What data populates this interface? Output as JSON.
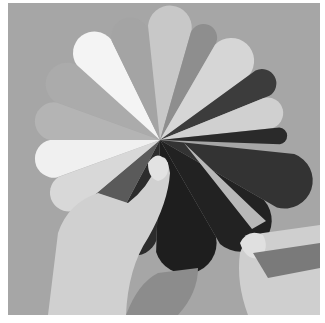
{
  "image": {
    "subject": "Hands holding a paper fan-shaped color wheel (grayscale photo)",
    "style": "grayscale photograph",
    "colors": {
      "frame": "#ffffff",
      "background": "#a6a6a6",
      "skin": "#d2d2d2",
      "skin_shadow": "#9a9a9a"
    },
    "fan": {
      "center": [
        152,
        137
      ],
      "wedges": [
        {
          "start": 200,
          "end": 222,
          "radius": 112,
          "fill": "#ababab"
        },
        {
          "start": 222,
          "end": 244,
          "radius": 112,
          "fill": "#f4f4f4"
        },
        {
          "start": 244,
          "end": 264,
          "radius": 110,
          "fill": "#a4a4a4"
        },
        {
          "start": 264,
          "end": 286,
          "radius": 115,
          "fill": "#c8c8c8"
        },
        {
          "start": 286,
          "end": 300,
          "radius": 112,
          "fill": "#8e8e8e"
        },
        {
          "start": 300,
          "end": 324,
          "radius": 110,
          "fill": "#d6d6d6"
        },
        {
          "start": 324,
          "end": 338,
          "radius": 118,
          "fill": "#3c3c3c"
        },
        {
          "start": 338,
          "end": 354,
          "radius": 112,
          "fill": "#d0d0d0"
        },
        {
          "start": 354,
          "end": 362,
          "radius": 120,
          "fill": "#2a2a2a"
        },
        {
          "start": 6,
          "end": 30,
          "radius": 135,
          "fill": "#333333"
        },
        {
          "start": 30,
          "end": 60,
          "radius": 120,
          "fill": "#222222"
        },
        {
          "start": 60,
          "end": 92,
          "radius": 112,
          "fill": "#1e1e1e"
        },
        {
          "start": 92,
          "end": 118,
          "radius": 100,
          "fill": "#2c2c2c"
        },
        {
          "start": 118,
          "end": 140,
          "radius": 104,
          "fill": "#5a5a5a"
        },
        {
          "start": 140,
          "end": 160,
          "radius": 108,
          "fill": "#d8d8d8"
        },
        {
          "start": 160,
          "end": 180,
          "radius": 110,
          "fill": "#f0f0f0"
        },
        {
          "start": 180,
          "end": 200,
          "radius": 110,
          "fill": "#b4b4b4"
        }
      ],
      "held_wedge": {
        "points": "176,140 244,205 258,218 244,226",
        "fill": "#b8b8b8"
      }
    }
  }
}
